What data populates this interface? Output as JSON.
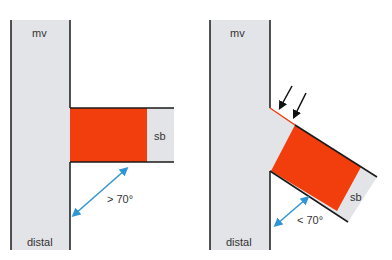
{
  "colors": {
    "vessel_fill": "#e3e4e8",
    "vessel_stroke": "#1a1a1a",
    "stent_fill": "#f23d0c",
    "arrow_blue": "#2f95d4",
    "arrow_black": "#111111"
  },
  "left_panel": {
    "main_vessel_label": "mv",
    "distal_label": "distal",
    "side_branch_label": "sb",
    "angle_label": "> 70°"
  },
  "right_panel": {
    "main_vessel_label": "mv",
    "distal_label": "distal",
    "side_branch_label": "sb",
    "angle_label": "< 70°",
    "pointer_arrows_count": 2
  }
}
